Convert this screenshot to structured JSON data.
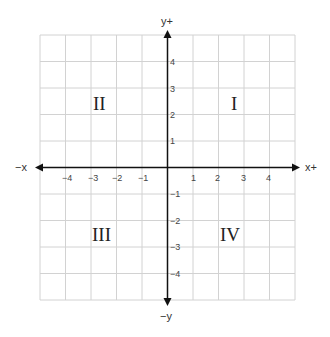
{
  "diagram": {
    "axes": {
      "x_positive_label": "x+",
      "x_negative_label": "−x",
      "y_positive_label": "y+",
      "y_negative_label": "−y"
    },
    "x_ticks": [
      "−4",
      "−3",
      "−2",
      "−1",
      "1",
      "2",
      "3",
      "4"
    ],
    "y_ticks": [
      "4",
      "3",
      "2",
      "1",
      "−1",
      "−2",
      "−3",
      "−4"
    ],
    "quadrants": {
      "I": "I",
      "II": "II",
      "III": "III",
      "IV": "IV"
    },
    "grid": {
      "range": [
        -5,
        5
      ],
      "cell_px": 25.5,
      "line_color": "#d4d4d4",
      "axis_color": "#111111"
    }
  }
}
